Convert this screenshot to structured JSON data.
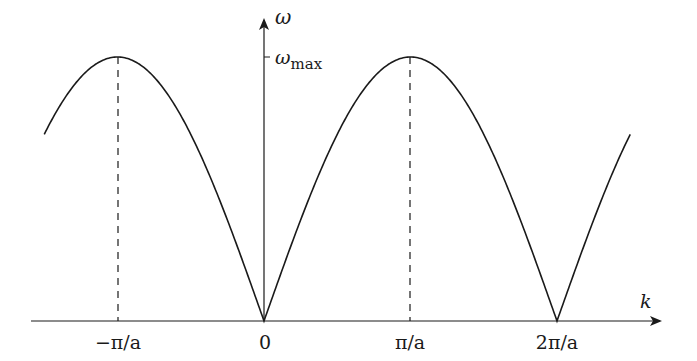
{
  "diagram": {
    "function": "omega = omega_max * |sin(k a / 2)|",
    "axes": {
      "x_label": "k",
      "y_label": "ω",
      "y_tick_label_base": "ω",
      "y_tick_label_sub": "max"
    },
    "x_ticks": [
      {
        "label": "−π/a",
        "value": -1
      },
      {
        "label": "0",
        "value": 0
      },
      {
        "label": "π/a",
        "value": 1
      },
      {
        "label": "2π/a",
        "value": 2
      }
    ],
    "curve_range_k": [
      -1.5,
      2.5
    ],
    "dashed_lines_at": [
      "−π/a",
      "π/a"
    ],
    "colors": {
      "line": "#1a1a1a",
      "background": "#ffffff"
    }
  },
  "chart_data": {
    "type": "line",
    "title": "",
    "xlabel": "k",
    "ylabel": "ω",
    "x_tick_labels": [
      "−π/a",
      "0",
      "π/a",
      "2π/a"
    ],
    "y_tick_labels": [
      "ω_max"
    ],
    "series": [
      {
        "name": "ω(k) = ω_max|sin(ka/2)|",
        "x": [
          -1.5,
          -1.0,
          -0.5,
          0.0,
          0.5,
          1.0,
          1.5,
          2.0,
          2.5
        ],
        "values": [
          0.707,
          1.0,
          0.707,
          0.0,
          0.707,
          1.0,
          0.707,
          0.0,
          0.707
        ]
      }
    ],
    "annotations": [
      "dashed vertical lines at k = −π/a and k = π/a marking ω_max"
    ]
  }
}
